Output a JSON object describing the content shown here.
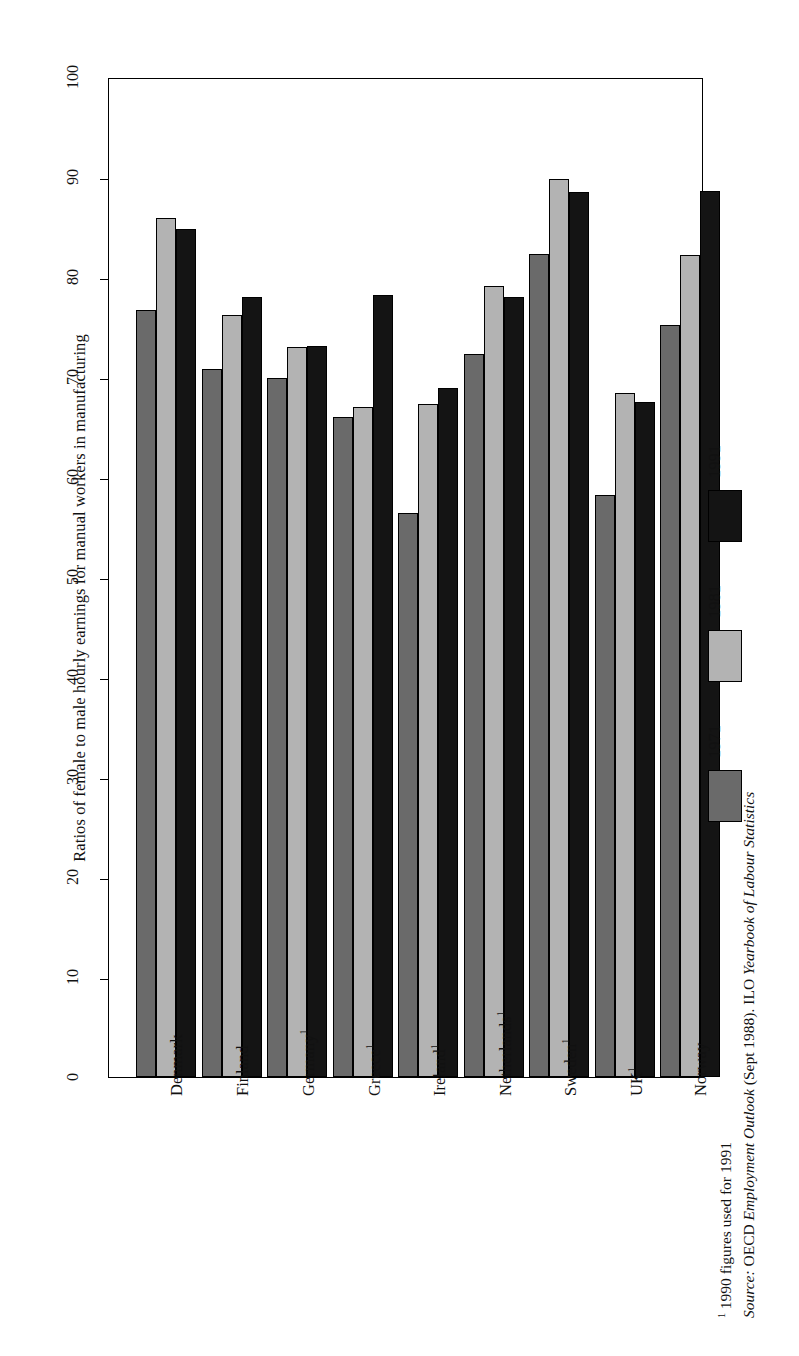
{
  "chart_data": {
    "type": "bar",
    "title": "",
    "ylabel": "Ratios of female to male hourly earnings for manual workers in manufacturing",
    "xlabel": "",
    "ylim": [
      0,
      100
    ],
    "yticks": [
      0,
      10,
      20,
      30,
      40,
      50,
      60,
      70,
      80,
      90,
      100
    ],
    "grid": false,
    "orientation": "vertical-bars-on-rotated-page",
    "legend_position": "right",
    "categories": [
      "Denmark",
      "Finland",
      "Germany¹",
      "Greece¹",
      "Ireland¹",
      "Netherlands¹",
      "Sweden¹",
      "UK¹",
      "Norway"
    ],
    "series": [
      {
        "name": "1971",
        "color": "#6a6a6a",
        "values": [
          76.7,
          70.8,
          69.9,
          66.0,
          56.4,
          72.3,
          82.3,
          58.2,
          75.2
        ]
      },
      {
        "name": "1981",
        "color": "#b3b3b3",
        "values": [
          85.9,
          76.2,
          73.0,
          67.0,
          67.3,
          79.1,
          89.8,
          68.4,
          82.2
        ]
      },
      {
        "name": "1991",
        "color": "#141414",
        "values": [
          84.8,
          78.0,
          73.1,
          78.2,
          68.9,
          78.0,
          88.5,
          67.5,
          88.6
        ]
      }
    ]
  },
  "axis": {
    "tick_labels": [
      "0",
      "10",
      "20",
      "30",
      "40",
      "50",
      "60",
      "70",
      "80",
      "90",
      "100"
    ]
  },
  "legend": {
    "items": [
      {
        "label": "1971",
        "color": "#6a6a6a"
      },
      {
        "label": "1981",
        "color": "#b3b3b3"
      },
      {
        "label": "1991",
        "color": "#141414"
      }
    ]
  },
  "footnotes": {
    "marker": "1",
    "footnote": " 1990 figures used for 1991",
    "source_label": "Source:",
    "source_plain_1": " OECD ",
    "source_italic_1": "Employment Outlook",
    "source_plain_2": " (Sept 1988). ILO ",
    "source_italic_2": "Yearbook of Labour Statistics"
  }
}
